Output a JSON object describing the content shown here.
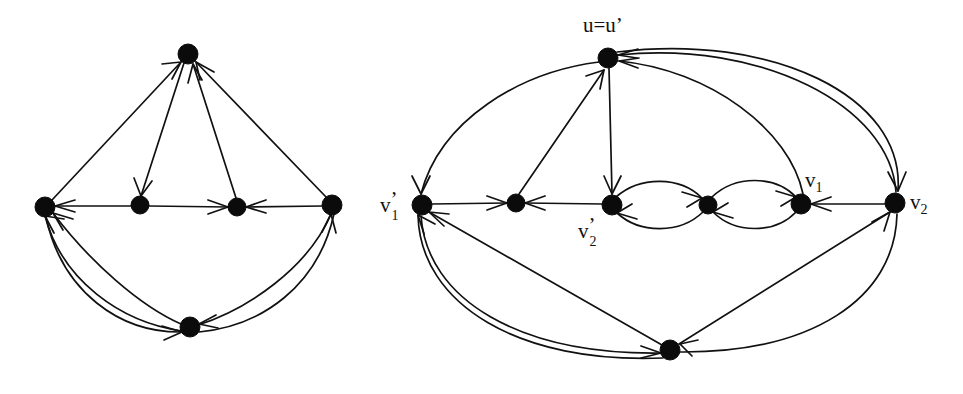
{
  "figure": {
    "background_color": "#ffffff",
    "ink_color": "#111111",
    "node_color": "#0b0b0b",
    "node_radius": 9,
    "width": 963,
    "height": 394
  },
  "left_graph": {
    "name": "left-digraph",
    "node_count": 6,
    "edge_count": 9,
    "nodes": [
      {
        "id": "L-top",
        "label": "",
        "x": 188,
        "y": 54
      },
      {
        "id": "L-left",
        "label": "",
        "x": 45,
        "y": 207
      },
      {
        "id": "L-m1",
        "label": "",
        "x": 140,
        "y": 205
      },
      {
        "id": "L-m2",
        "label": "",
        "x": 237,
        "y": 207
      },
      {
        "id": "L-right",
        "label": "",
        "x": 332,
        "y": 205
      },
      {
        "id": "L-bot",
        "label": "",
        "x": 190,
        "y": 327
      }
    ]
  },
  "right_graph": {
    "name": "right-digraph",
    "node_count": 7,
    "edge_count": 13,
    "nodes": [
      {
        "id": "R-u",
        "label_text": "u=u'",
        "label_base": "u=u",
        "label_prime": "’",
        "label_sub": "",
        "x": 608,
        "y": 58
      },
      {
        "id": "R-v1p",
        "label_text": "v1'",
        "label_base": "v",
        "label_prime": "’",
        "label_sub": "1",
        "x": 422,
        "y": 205
      },
      {
        "id": "R-a",
        "label_text": "",
        "label_base": "",
        "label_prime": "",
        "label_sub": "",
        "x": 516,
        "y": 203
      },
      {
        "id": "R-v2p",
        "label_text": "v2'",
        "label_base": "v",
        "label_prime": "’",
        "label_sub": "2",
        "x": 612,
        "y": 205
      },
      {
        "id": "R-b",
        "label_text": "",
        "label_base": "",
        "label_prime": "",
        "label_sub": "",
        "x": 708,
        "y": 205
      },
      {
        "id": "R-v1",
        "label_text": "v1",
        "label_base": "v",
        "label_prime": "",
        "label_sub": "1",
        "x": 801,
        "y": 204
      },
      {
        "id": "R-v2",
        "label_text": "v2",
        "label_base": "v",
        "label_prime": "",
        "label_sub": "2",
        "x": 895,
        "y": 203
      },
      {
        "id": "R-bot",
        "label_text": "",
        "label_base": "",
        "label_prime": "",
        "label_sub": "",
        "x": 670,
        "y": 350
      }
    ],
    "labels": [
      {
        "name": "label-u",
        "text": "u=u’",
        "x": 588,
        "y": 30
      },
      {
        "name": "label-v1p",
        "text": "v’1",
        "x": 385,
        "y": 212
      },
      {
        "name": "label-v2p",
        "text": "v’2",
        "x": 582,
        "y": 243
      },
      {
        "name": "label-v1",
        "text": "v1",
        "x": 806,
        "y": 188
      },
      {
        "name": "label-v2",
        "text": "v2",
        "x": 910,
        "y": 210
      }
    ]
  }
}
